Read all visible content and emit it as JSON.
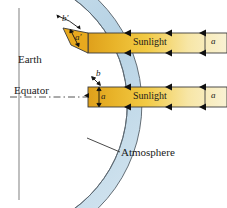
{
  "figure": {
    "background_color": "#ffffff"
  },
  "colors": {
    "atmosphere_fill": "#b8d3e3",
    "atmosphere_stroke": "#4a4a4a",
    "earth_fill": "#ffffff",
    "beam_dark": "#e0a21c",
    "beam_mid": "#f0c53c",
    "beam_light": "#f7efc8",
    "beam_stroke": "#3a3a3a",
    "label_text": "#1a1a1a",
    "equator_line": "#555555"
  },
  "labels": {
    "earth": "Earth",
    "equator": "Equator",
    "atmosphere": "Atmosphere",
    "sunlight_upper": "Sunlight",
    "sunlight_lower": "Sunlight",
    "b_prime": "b′",
    "a_prime": "a′",
    "b": "b",
    "a": "a",
    "a_upper_right": "a",
    "a_lower_right": "a"
  },
  "beams": [
    {
      "name": "oblique-beam",
      "label": "Sunlight",
      "right_segment_label": "a",
      "entry_thickness_label": "a′",
      "path_length_label": "b′",
      "y_top": 33,
      "y_bottom": 53,
      "x_start": 88,
      "x_end": 227,
      "arrow_count": 4,
      "direction": "leftward"
    },
    {
      "name": "equatorial-beam",
      "label": "Sunlight",
      "right_segment_label": "a",
      "entry_thickness_label": "a",
      "path_length_label": "b",
      "y_top": 87,
      "y_bottom": 107,
      "x_start": 88,
      "x_end": 227,
      "arrow_count": 4,
      "direction": "leftward"
    }
  ],
  "earth": {
    "center_x": -35,
    "center_y": 104,
    "surface_radius": 128,
    "atmosphere_outer_radius": 145
  }
}
